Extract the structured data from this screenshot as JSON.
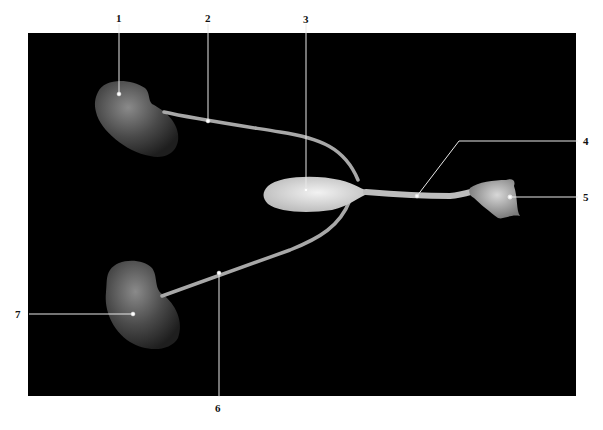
{
  "figure": {
    "background": "#000000",
    "leader_color": "#e8e8e8",
    "labels": [
      {
        "id": "1",
        "text": "1"
      },
      {
        "id": "2",
        "text": "2"
      },
      {
        "id": "3",
        "text": "3"
      },
      {
        "id": "4",
        "text": "4"
      },
      {
        "id": "5",
        "text": "5"
      },
      {
        "id": "6",
        "text": "6"
      },
      {
        "id": "7",
        "text": "7"
      }
    ]
  }
}
